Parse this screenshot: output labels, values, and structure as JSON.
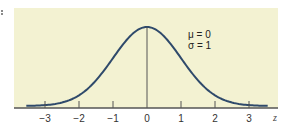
{
  "chart_data": {
    "type": "line",
    "title": "",
    "xlabel": "z",
    "ylabel": "",
    "distribution": "standard normal",
    "parameters": [
      {
        "label": "μ = 0",
        "symbol": "μ",
        "value": 0
      },
      {
        "label": "σ = 1",
        "symbol": "σ",
        "value": 1
      }
    ],
    "mean": 0,
    "sd": 1,
    "xlim": [
      -3.5,
      3.5
    ],
    "ticks": [
      -3,
      -2,
      -1,
      0,
      1,
      2,
      3
    ],
    "tick_labels": [
      "−3",
      "−2",
      "−1",
      "0",
      "1",
      "2",
      "3"
    ],
    "series": [
      {
        "name": "density",
        "x": [
          -3.5,
          -3,
          -2.5,
          -2,
          -1.5,
          -1,
          -0.5,
          0,
          0.5,
          1,
          1.5,
          2,
          2.5,
          3,
          3.5
        ],
        "values": [
          0.0009,
          0.0044,
          0.0175,
          0.054,
          0.1295,
          0.242,
          0.3521,
          0.3989,
          0.3521,
          0.242,
          0.1295,
          0.054,
          0.0175,
          0.0044,
          0.0009
        ]
      }
    ],
    "annotations": [
      "vertical line at mean z = 0"
    ],
    "grid": false,
    "legend": "none",
    "colors": {
      "background": "#f3f2d2",
      "curve": "#2f4a6b",
      "axis": "#555555",
      "mean_line": "#555555"
    }
  }
}
